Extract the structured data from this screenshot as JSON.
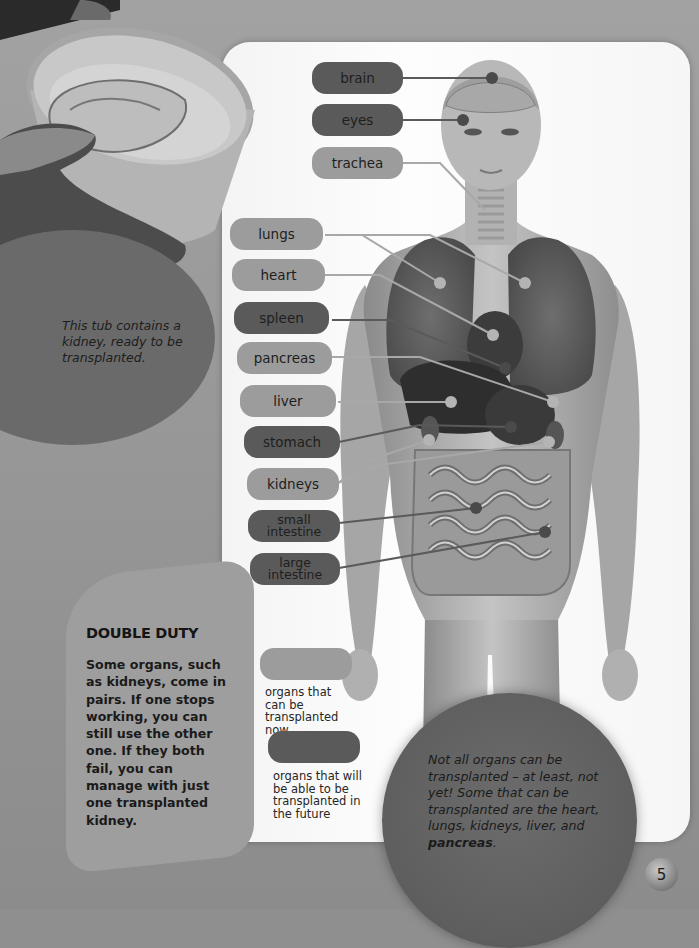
{
  "photo": {
    "subject": "hand-holding-tub-with-kidney",
    "caption": "This tub contains a kidney, ready to be transplanted."
  },
  "labels": [
    {
      "id": "brain",
      "text": "brain",
      "status": "future"
    },
    {
      "id": "eyes",
      "text": "eyes",
      "status": "future"
    },
    {
      "id": "trachea",
      "text": "trachea",
      "status": "now"
    },
    {
      "id": "lungs",
      "text": "lungs",
      "status": "now"
    },
    {
      "id": "heart",
      "text": "heart",
      "status": "now"
    },
    {
      "id": "spleen",
      "text": "spleen",
      "status": "future"
    },
    {
      "id": "pancreas",
      "text": "pancreas",
      "status": "now"
    },
    {
      "id": "liver",
      "text": "liver",
      "status": "now"
    },
    {
      "id": "stomach",
      "text": "stomach",
      "status": "future"
    },
    {
      "id": "kidneys",
      "text": "kidneys",
      "status": "now"
    },
    {
      "id": "small-intestine",
      "text": "small intestine",
      "line1": "small",
      "line2": "intestine",
      "status": "future"
    },
    {
      "id": "large-intestine",
      "text": "large intestine",
      "line1": "large",
      "line2": "intestine",
      "status": "future"
    }
  ],
  "sidebar": {
    "title": "DOUBLE DUTY",
    "body": "Some organs, such as kidneys, come in pairs. If one stops working, you can still use the other one. If they both fail, you can manage with just one transplanted kidney."
  },
  "legend": [
    {
      "status": "now",
      "text": "organs that can be transplanted now",
      "color": "#9c9c9c"
    },
    {
      "status": "future",
      "text": "organs that will be able to be transplanted in the future",
      "color": "#5a5a5a"
    }
  ],
  "info": {
    "text_before": "Not all organs can be transplanted – at least, not yet! Some that can be transplanted are the heart, lungs, kidneys, liver, and ",
    "text_bold": "pancreas",
    "text_after": "."
  },
  "page_number": "5",
  "colors": {
    "now": "#9c9c9c",
    "future": "#5a5a5a",
    "panel": "#fafafa",
    "background": "#8f8f8f"
  }
}
